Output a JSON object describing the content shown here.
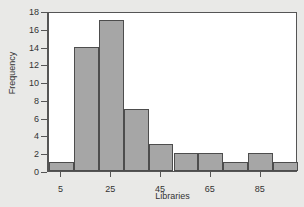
{
  "chart_data": {
    "type": "bar",
    "title": "",
    "subtitle": "",
    "xlabel": "Libraries",
    "ylabel": "Frequency",
    "grid": false,
    "legend": null,
    "legend_position": "none",
    "xlim": [
      0,
      100
    ],
    "ylim": [
      0,
      18
    ],
    "bin_width": 10,
    "x_tick_values": [
      5,
      25,
      45,
      65,
      85
    ],
    "x_tick_labels": [
      "5",
      "25",
      "45",
      "65",
      "85"
    ],
    "y_tick_values": [
      0,
      2,
      4,
      6,
      8,
      10,
      12,
      14,
      16,
      18
    ],
    "y_tick_labels": [
      "0",
      "2",
      "4",
      "6",
      "8",
      "10",
      "12",
      "14",
      "16",
      "18"
    ],
    "bin_edges": [
      0,
      10,
      20,
      30,
      40,
      50,
      60,
      70,
      80,
      90,
      100
    ],
    "bin_centers": [
      5,
      15,
      25,
      35,
      45,
      55,
      65,
      75,
      85,
      95
    ],
    "categories": [
      "0-10",
      "10-20",
      "20-30",
      "30-40",
      "40-50",
      "50-60",
      "60-70",
      "70-80",
      "80-90",
      "90-100"
    ],
    "values": [
      1,
      14,
      17,
      7,
      3,
      2,
      2,
      1,
      2,
      1
    ],
    "colors": {
      "bar_fill": "#a6a6a6",
      "bar_edge": "#4d4d4d",
      "axis": "#555555",
      "text": "#333333",
      "plot_background": "#ffffff",
      "figure_background": "#e9e9e7"
    }
  }
}
